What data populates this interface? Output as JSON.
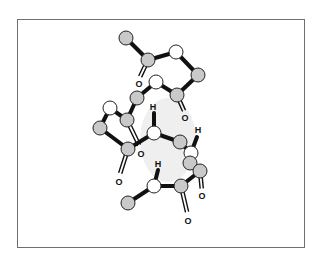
{
  "diagram": {
    "kind": "ball-and-stick molecular model",
    "colors": {
      "carbon_fill": "#c9c9c9",
      "nitrogen_fill": "#ffffff",
      "outline": "#222222",
      "bond": "#111111",
      "frame": "#6f6f6f",
      "shadow": "#ececec"
    },
    "atoms": [
      {
        "id": "a1",
        "type": "C"
      },
      {
        "id": "a2",
        "type": "C"
      },
      {
        "id": "a3",
        "type": "N"
      },
      {
        "id": "a4",
        "type": "C"
      },
      {
        "id": "a5",
        "type": "N"
      },
      {
        "id": "a6",
        "type": "C"
      },
      {
        "id": "a7",
        "type": "C"
      },
      {
        "id": "a8",
        "type": "N"
      },
      {
        "id": "a9",
        "type": "C"
      },
      {
        "id": "a10",
        "type": "C"
      },
      {
        "id": "a11",
        "type": "C"
      },
      {
        "id": "a12",
        "type": "N"
      },
      {
        "id": "a13",
        "type": "C"
      },
      {
        "id": "a14",
        "type": "N"
      },
      {
        "id": "a15",
        "type": "C"
      },
      {
        "id": "a16",
        "type": "C"
      },
      {
        "id": "a17",
        "type": "N"
      },
      {
        "id": "a18",
        "type": "C"
      },
      {
        "id": "a19",
        "type": "C"
      }
    ],
    "labels": [
      {
        "id": "o1",
        "text": "O"
      },
      {
        "id": "o2",
        "text": "O"
      },
      {
        "id": "o3",
        "text": "O"
      },
      {
        "id": "o4",
        "text": "O"
      },
      {
        "id": "o5",
        "text": "O"
      },
      {
        "id": "o6",
        "text": "O"
      },
      {
        "id": "h1",
        "text": "H"
      },
      {
        "id": "h2",
        "text": "H"
      },
      {
        "id": "h3",
        "text": "H"
      }
    ]
  }
}
